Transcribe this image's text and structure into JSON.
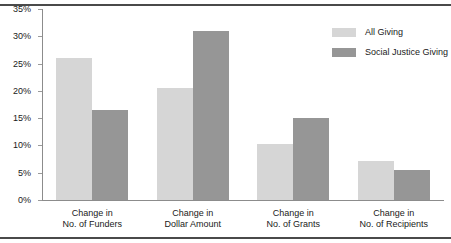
{
  "chart_data": {
    "type": "bar",
    "title": "",
    "xlabel": "",
    "ylabel": "",
    "ylim": [
      0,
      35
    ],
    "ytick_step": 5,
    "ytick_labels": [
      "0%",
      "5%",
      "10%",
      "15%",
      "20%",
      "25%",
      "30%",
      "35%"
    ],
    "ytick_values": [
      0,
      5,
      10,
      15,
      20,
      25,
      30,
      35
    ],
    "grid": false,
    "legend_position": "top-right",
    "categories": [
      "Change in\nNo. of Funders",
      "Change in\nDollar Amount",
      "Change in\nNo. of Grants",
      "Change in\nNo. of Recipients"
    ],
    "category_lines": [
      [
        "Change in",
        "No. of Funders"
      ],
      [
        "Change in",
        "Dollar Amount"
      ],
      [
        "Change in",
        "No. of Grants"
      ],
      [
        "Change in",
        "No. of Recipients"
      ]
    ],
    "series": [
      {
        "name": "All Giving",
        "color": "#d6d6d6",
        "values": [
          26.0,
          20.5,
          10.3,
          7.2
        ]
      },
      {
        "name": "Social Justice Giving",
        "color": "#969696",
        "values": [
          16.5,
          31.0,
          15.0,
          5.5
        ]
      }
    ]
  },
  "colors": {
    "all_giving": "#d6d6d6",
    "social_justice_giving": "#969696",
    "axis": "#8c8c8c",
    "rule": "#4a4a4a",
    "text": "#1a1a1a"
  }
}
